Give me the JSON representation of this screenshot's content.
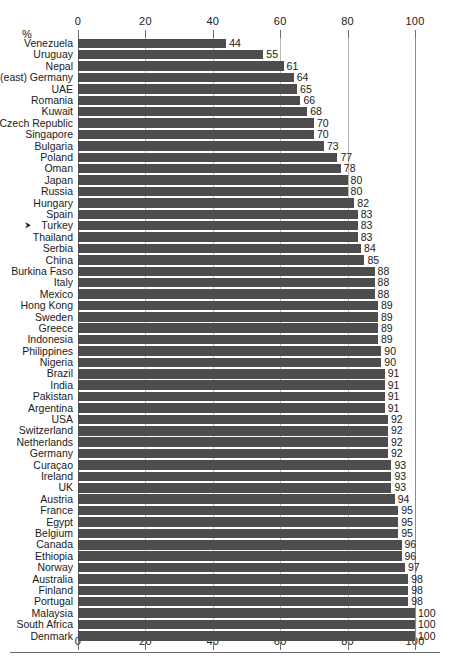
{
  "chart": {
    "type": "bar",
    "orientation": "horizontal",
    "unit_label": "%",
    "xlabel": "",
    "ylabel": "",
    "title": "",
    "xlim": [
      0,
      100
    ],
    "ticks": [
      0,
      20,
      40,
      60,
      80,
      100
    ],
    "tick_labels": [
      "0",
      "20",
      "40",
      "60",
      "80",
      "100"
    ],
    "grid": true,
    "legend": "none",
    "bar_color": "#4d4d4d",
    "gridline_color": "#8d8d8d",
    "axis_color": "#6e6e6e",
    "marked_row": "Turkey",
    "marker_glyph": "⮞"
  },
  "chart_data": {
    "type": "bar",
    "title": "",
    "xlabel": "",
    "ylabel": "",
    "unit": "%",
    "xlim": [
      0,
      100
    ],
    "ticks": [
      0,
      20,
      40,
      60,
      80,
      100
    ],
    "grid": true,
    "legend": "none",
    "categories": [
      "Venezuela",
      "Uruguay",
      "Nepal",
      "(east) Germany",
      "UAE",
      "Romania",
      "Kuwait",
      "Czech Republic",
      "Singapore",
      "Bulgaria",
      "Poland",
      "Oman",
      "Japan",
      "Russia",
      "Hungary",
      "Spain",
      "Turkey",
      "Thailand",
      "Serbia",
      "China",
      "Burkina Faso",
      "Italy",
      "Mexico",
      "Hong Kong",
      "Sweden",
      "Greece",
      "Indonesia",
      "Philippines",
      "Nigeria",
      "Brazil",
      "India",
      "Pakistan",
      "Argentina",
      "USA",
      "Switzerland",
      "Netherlands",
      "Germany",
      "Curaçao",
      "Ireland",
      "UK",
      "Austria",
      "France",
      "Egypt",
      "Belgium",
      "Canada",
      "Ethiopia",
      "Norway",
      "Australia",
      "Finland",
      "Portugal",
      "Malaysia",
      "South Africa",
      "Denmark"
    ],
    "values": [
      44,
      55,
      61,
      64,
      65,
      66,
      68,
      70,
      70,
      73,
      77,
      78,
      80,
      80,
      82,
      83,
      83,
      83,
      84,
      85,
      88,
      88,
      88,
      89,
      89,
      89,
      89,
      90,
      90,
      91,
      91,
      91,
      91,
      92,
      92,
      92,
      92,
      93,
      93,
      93,
      94,
      95,
      95,
      95,
      96,
      96,
      97,
      98,
      98,
      98,
      100,
      100,
      100
    ],
    "value_labels": [
      "44",
      "55",
      "61",
      "64",
      "65",
      "66",
      "68",
      "70",
      "70",
      "73",
      "77",
      "78",
      "80",
      "80",
      "82",
      "83",
      "83",
      "83",
      "84",
      "85",
      "88",
      "88",
      "88",
      "89",
      "89",
      "89",
      "89",
      "90",
      "90",
      "91",
      "91",
      "91",
      "91",
      "92",
      "92",
      "92",
      "92",
      "93",
      "93",
      "93",
      "94",
      "95",
      "95",
      "95",
      "96",
      "96",
      "97",
      "98",
      "98",
      "98",
      "100",
      "100",
      "100"
    ]
  }
}
